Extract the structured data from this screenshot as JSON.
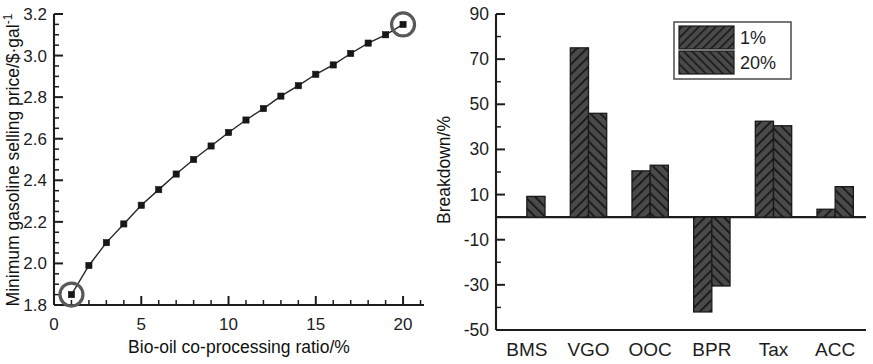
{
  "figure": {
    "title": "",
    "panels": [
      "line-chart",
      "bar-chart"
    ]
  },
  "chart_data": [
    {
      "id": "msp-vs-ratio",
      "type": "line",
      "title": "",
      "xlabel": "Bio-oil co-processing ratio/%",
      "ylabel": "Minimum gasoline selling price/$·gal⁻¹",
      "ylabel_main": "Minimum gasoline selling price/$·gal",
      "ylabel_sup": "-1",
      "xlim": [
        0,
        21.2
      ],
      "ylim": [
        1.8,
        3.2
      ],
      "xticks": [
        0,
        5,
        10,
        15,
        20
      ],
      "xticklabels": [
        "0",
        "5",
        "10",
        "15",
        "20"
      ],
      "yticks": [
        1.8,
        2.0,
        2.2,
        2.4,
        2.6,
        2.8,
        3.0,
        3.2
      ],
      "yticklabels": [
        "1.8",
        "2.0",
        "2.2",
        "2.4",
        "2.6",
        "2.8",
        "3.0",
        "3.2"
      ],
      "x_minor_step": 1,
      "y_minor_step": 0.05,
      "grid": false,
      "legend": null,
      "marker": "filled-square",
      "x": [
        1,
        2,
        3,
        4,
        5,
        6,
        7,
        8,
        9,
        10,
        11,
        12,
        13,
        14,
        15,
        16,
        17,
        18,
        19,
        20
      ],
      "values": [
        1.85,
        1.99,
        2.1,
        2.19,
        2.28,
        2.355,
        2.43,
        2.5,
        2.565,
        2.63,
        2.69,
        2.745,
        2.805,
        2.855,
        2.91,
        2.955,
        3.01,
        3.06,
        3.1,
        3.15
      ],
      "annotations": [
        {
          "name": "highlight-first-point",
          "x": 1,
          "y": 1.85,
          "shape": "circle-outline"
        },
        {
          "name": "highlight-last-point",
          "x": 20,
          "y": 3.15,
          "shape": "circle-outline"
        }
      ]
    },
    {
      "id": "cost-breakdown",
      "type": "bar",
      "title": "",
      "xlabel": "",
      "ylabel": "Breakdown/%",
      "categories": [
        "BMS",
        "VGO",
        "OOC",
        "BPR",
        "Tax",
        "ACC"
      ],
      "ylim": [
        -50,
        90
      ],
      "yticks": [
        -50,
        -30,
        -10,
        10,
        30,
        50,
        70,
        90
      ],
      "yticklabels": [
        "-50",
        "-30",
        "-10",
        "10",
        "30",
        "50",
        "70",
        "90"
      ],
      "y_minor_step": 10,
      "grid": false,
      "legend_position": "top-right",
      "series": [
        {
          "name": "1%",
          "hatch": "forward-diagonal",
          "values": [
            0.3,
            75.0,
            20.5,
            -42.0,
            42.5,
            3.5
          ]
        },
        {
          "name": "20%",
          "hatch": "backward-diagonal",
          "values": [
            9.2,
            46.0,
            23.0,
            -30.5,
            40.5,
            13.5
          ]
        }
      ]
    }
  ]
}
